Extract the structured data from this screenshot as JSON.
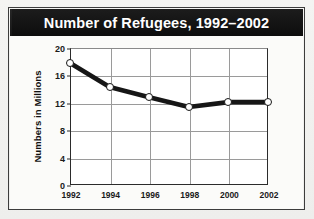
{
  "figure": {
    "title": "Number of Refugees, 1992–2002",
    "banner_color": "#151515",
    "title_color": "#ffffff",
    "panel_color": "#fbfbf9",
    "page_background": "#f2f2f0",
    "frame_color": "#3c3c3c"
  },
  "chart_data": {
    "type": "line",
    "title": "Number of Refugees, 1992–2002",
    "xlabel": "",
    "ylabel": "Numbers in Millions",
    "categories": [
      "1992",
      "1994",
      "1996",
      "1998",
      "2000",
      "2002"
    ],
    "x": [
      1992,
      1994,
      1996,
      1998,
      2000,
      2002
    ],
    "values": [
      17.8,
      14.3,
      12.8,
      11.4,
      12.1,
      12.1
    ],
    "series": [
      {
        "name": "Number of Refugees",
        "values": [
          17.8,
          14.3,
          12.8,
          11.4,
          12.1,
          12.1
        ],
        "line_color": "#161616",
        "marker_face_color": "#ffffff",
        "marker_edge_color": "#161616"
      }
    ],
    "ylim": [
      0,
      20
    ],
    "yticks": [
      0,
      4,
      8,
      12,
      16,
      20
    ],
    "ytick_labels": [
      "0",
      "4",
      "8",
      "12",
      "16",
      "20"
    ],
    "xtick_labels": [
      "1992",
      "1994",
      "1996",
      "1998",
      "2000",
      "2002"
    ],
    "grid": true,
    "grid_color": "#9a9a9a",
    "legend": false,
    "legend_position": "none",
    "axis_color": "#2b2b2b"
  }
}
